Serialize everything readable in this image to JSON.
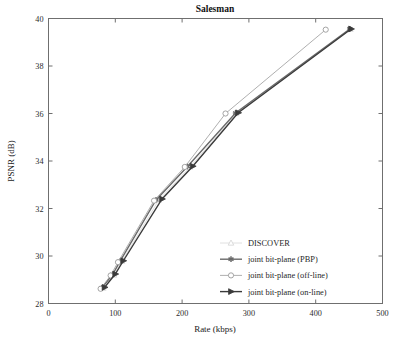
{
  "chart_data": {
    "type": "line",
    "title": "Salesman",
    "xlabel": "Rate (kbps)",
    "ylabel": "PSNR (dB)",
    "xlim": [
      0,
      500
    ],
    "ylim": [
      28,
      40
    ],
    "xticks": [
      0,
      100,
      200,
      300,
      400,
      500
    ],
    "yticks": [
      28,
      30,
      32,
      34,
      36,
      38,
      40
    ],
    "grid": false,
    "legend_position": "lower-right-inside",
    "series": [
      {
        "name": "DISCOVER",
        "marker": "triangle-up",
        "color": "#d8d8d8",
        "x": [
          82,
          98,
          110,
          165,
          212,
          281,
          452
        ],
        "y": [
          28.65,
          29.2,
          29.78,
          32.35,
          33.75,
          36.0,
          39.55
        ]
      },
      {
        "name": "joint bit-plane (PBP)",
        "marker": "star",
        "color": "#6a6a6a",
        "x": [
          80,
          96,
          107,
          161,
          208,
          280,
          451
        ],
        "y": [
          28.66,
          29.22,
          29.77,
          32.36,
          33.77,
          36.02,
          39.56
        ]
      },
      {
        "name": "joint bit-plane (off-line)",
        "marker": "circle-open",
        "color": "#9a9a9a",
        "x": [
          78,
          93,
          104,
          158,
          204,
          265,
          415
        ],
        "y": [
          28.62,
          29.18,
          29.74,
          32.33,
          33.75,
          36.0,
          39.53
        ]
      },
      {
        "name": "joint bit-plane (on-line)",
        "marker": "triangle-right",
        "color": "#3a3a3a",
        "x": [
          84,
          100,
          112,
          170,
          216,
          284,
          453
        ],
        "y": [
          28.68,
          29.24,
          29.8,
          32.4,
          33.78,
          36.03,
          39.56
        ]
      }
    ]
  },
  "legend": {
    "entries": [
      {
        "label": "DISCOVER"
      },
      {
        "label": "joint bit-plane (PBP)"
      },
      {
        "label": "joint bit-plane (off-line)"
      },
      {
        "label": "joint bit-plane (on-line)"
      }
    ]
  },
  "colors": {
    "frame": "#6f6f6f",
    "text": "#1a1a1a",
    "background": "#ffffff"
  }
}
